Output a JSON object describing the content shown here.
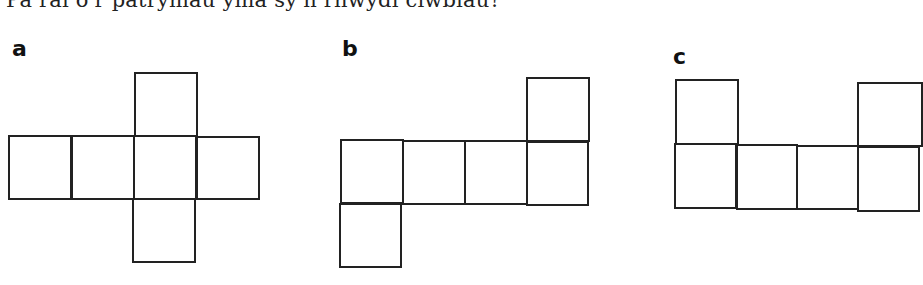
{
  "question": "Pa rai o'r patrymau yma sy'n rhwydi ciwbiau?",
  "options": [
    {
      "label": "a",
      "label_pos": [
        12,
        38
      ],
      "squares": [
        [
          134,
          72,
          64,
          65
        ],
        [
          8,
          135,
          64,
          65
        ],
        [
          71,
          135,
          64,
          65
        ],
        [
          133,
          135,
          64,
          65
        ],
        [
          196,
          136,
          64,
          64
        ],
        [
          132,
          198,
          64,
          65
        ]
      ]
    },
    {
      "label": "b",
      "label_pos": [
        342,
        38
      ],
      "squares": [
        [
          526,
          77,
          64,
          65
        ],
        [
          340,
          139,
          64,
          65
        ],
        [
          402,
          140,
          64,
          65
        ],
        [
          464,
          140,
          64,
          65
        ],
        [
          526,
          141,
          63,
          65
        ],
        [
          339,
          203,
          63,
          65
        ]
      ]
    },
    {
      "label": "c",
      "label_pos": [
        673,
        46
      ],
      "squares": [
        [
          675,
          79,
          64,
          66
        ],
        [
          857,
          82,
          66,
          65
        ],
        [
          674,
          143,
          63,
          66
        ],
        [
          736,
          144,
          62,
          66
        ],
        [
          796,
          145,
          63,
          65
        ],
        [
          857,
          146,
          63,
          66
        ]
      ]
    }
  ]
}
